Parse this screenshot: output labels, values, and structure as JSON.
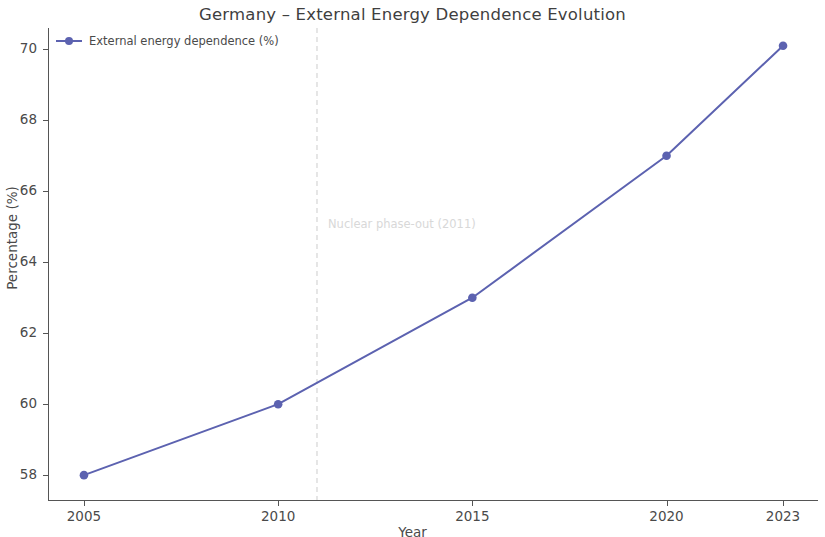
{
  "chart_data": {
    "type": "line",
    "title": "Germany – External Energy Dependence Evolution",
    "xlabel": "Year",
    "ylabel": "Percentage (%)",
    "x": [
      2005,
      2010,
      2015,
      2020,
      2023
    ],
    "series": [
      {
        "name": "External energy dependence (%)",
        "values": [
          58.0,
          60.0,
          63.0,
          67.0,
          70.1
        ],
        "color": "#5c62b0",
        "marker": "circle"
      }
    ],
    "xlim": [
      2004.1,
      2023.9
    ],
    "ylim": [
      57.3,
      70.6
    ],
    "xticks": [
      2005,
      2010,
      2015,
      2020,
      2023
    ],
    "xtick_labels": [
      "2005",
      "2010",
      "2015",
      "2020",
      "2023"
    ],
    "yticks": [
      58,
      60,
      62,
      64,
      66,
      68,
      70
    ],
    "ytick_labels": [
      "58",
      "60",
      "62",
      "64",
      "66",
      "68",
      "70"
    ],
    "grid": false,
    "legend_position": "upper left",
    "annotations": [
      {
        "text": "Nuclear phase-out (2011)",
        "x": 2011,
        "type": "vertical-dashed-line",
        "line_color": "#cccccc",
        "text_color": "#d8d8d8"
      }
    ]
  },
  "legend": {
    "entries": [
      {
        "label": "External energy dependence (%)"
      }
    ]
  }
}
